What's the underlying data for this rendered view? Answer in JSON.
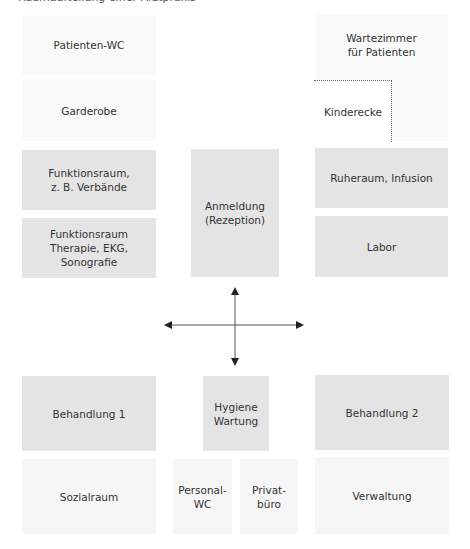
{
  "caption": "Raumaufteilung einer Arztpraxis",
  "rooms": {
    "patienten_wc": "Patienten-WC",
    "garderobe": "Garderobe",
    "wartezimmer": "Wartezimmer\nfür Patienten",
    "kinderecke": "Kinderecke",
    "funktionsraum_verbaende": "Funktionsraum,\nz. B. Verbände",
    "funktionsraum_therapie": "Funktionsraum\nTherapie, EKG, Sonografie",
    "anmeldung": "Anmeldung\n(Rezeption)",
    "ruheraum": "Ruheraum, Infusion",
    "labor": "Labor",
    "behandlung1": "Behandlung 1",
    "hygiene": "Hygiene\nWartung",
    "behandlung2": "Behandlung 2",
    "sozialraum": "Sozialraum",
    "personal_wc": "Personal-\nWC",
    "privatbuero": "Privat-\nbüro",
    "verwaltung": "Verwaltung"
  },
  "colors": {
    "dark_room": "#e4e4e4",
    "light_room": "#f6f6f6",
    "faint_room": "#f9f9f9",
    "arrow": "#222222"
  }
}
